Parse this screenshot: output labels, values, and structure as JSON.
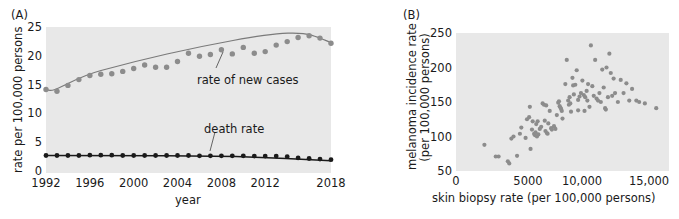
{
  "figure": {
    "background": "#ffffff",
    "plot_background": "#e8e8e8",
    "text_color": "#1a1a1a"
  },
  "panels": {
    "a": {
      "label": "(A)",
      "xlabel": "year",
      "ylabel": "rate per 100,000 persons",
      "yticks": [
        "0",
        "5",
        "10",
        "15",
        "20",
        "25"
      ],
      "xticks": [
        "1992",
        "1996",
        "2000",
        "2004",
        "2008",
        "2012",
        "2018"
      ],
      "annotation_new_cases": "rate of new cases",
      "annotation_death_rate": "death rate",
      "new_cases_color": "#8c8c8c",
      "death_rate_color": "#1a1a1a"
    },
    "b": {
      "label": "(B)",
      "xlabel": "skin biopsy rate (per 100,000 persons)",
      "ylabel_line1": "melanoma incidence rate",
      "ylabel_line2": "(per 100,000 persons)",
      "yticks": [
        "50",
        "100",
        "150",
        "200",
        "250"
      ],
      "xticks": [
        "0",
        "5000",
        "10,000",
        "15,000"
      ],
      "point_color": "#8c8c8c"
    }
  },
  "chart_data": [
    {
      "type": "line",
      "panel": "A",
      "title": "(A)",
      "xlabel": "year",
      "ylabel": "rate per 100,000 persons",
      "xlim": [
        1992,
        2018
      ],
      "ylim": [
        0,
        25
      ],
      "xticks": [
        1992,
        1996,
        2000,
        2004,
        2008,
        2012,
        2018
      ],
      "yticks": [
        0,
        5,
        10,
        15,
        20,
        25
      ],
      "grid": false,
      "legend": "inline-annotations",
      "x": [
        1992,
        1993,
        1994,
        1995,
        1996,
        1997,
        1998,
        1999,
        2000,
        2001,
        2002,
        2003,
        2004,
        2005,
        2006,
        2007,
        2008,
        2009,
        2010,
        2011,
        2012,
        2013,
        2014,
        2015,
        2016,
        2017,
        2018
      ],
      "series": [
        {
          "name": "rate of new cases",
          "marker": "circle",
          "color": "#8c8c8c",
          "trendline": true,
          "values": [
            14.3,
            14.0,
            15.0,
            16.0,
            16.7,
            16.9,
            17.0,
            17.4,
            17.9,
            18.5,
            18.1,
            18.1,
            19.1,
            20.5,
            20.0,
            20.3,
            21.1,
            20.4,
            21.5,
            20.5,
            20.8,
            21.9,
            22.5,
            23.2,
            23.5,
            23.1,
            22.2
          ]
        },
        {
          "name": "death rate",
          "marker": "circle",
          "color": "#1a1a1a",
          "trendline": true,
          "values": [
            3.0,
            3.0,
            3.0,
            3.0,
            3.05,
            3.05,
            3.05,
            3.0,
            3.0,
            3.0,
            3.0,
            3.0,
            3.0,
            3.0,
            2.95,
            2.95,
            2.95,
            2.95,
            2.95,
            2.9,
            2.9,
            2.9,
            2.8,
            2.6,
            2.5,
            2.4,
            2.3
          ]
        }
      ],
      "annotations": [
        {
          "text": "rate of new cases",
          "x": 2008,
          "y": 17.8
        },
        {
          "text": "death rate",
          "x": 2007,
          "y": 6.1
        }
      ]
    },
    {
      "type": "scatter",
      "panel": "B",
      "title": "(B)",
      "xlabel": "skin biopsy rate (per 100,000 persons)",
      "ylabel": "melanoma incidence rate (per 100,000 persons)",
      "xlim": [
        0,
        15000
      ],
      "ylim": [
        50,
        250
      ],
      "xticks": [
        0,
        5000,
        10000,
        15000
      ],
      "yticks": [
        50,
        100,
        150,
        200,
        250
      ],
      "grid": false,
      "marker": "circle",
      "color": "#8c8c8c",
      "points": [
        [
          2000,
          88
        ],
        [
          2800,
          71
        ],
        [
          3000,
          71
        ],
        [
          3650,
          64
        ],
        [
          3750,
          61
        ],
        [
          3900,
          97
        ],
        [
          4050,
          100
        ],
        [
          4300,
          72
        ],
        [
          4500,
          104
        ],
        [
          4600,
          113
        ],
        [
          4900,
          98
        ],
        [
          5000,
          125
        ],
        [
          5150,
          128
        ],
        [
          5200,
          143
        ],
        [
          5250,
          82
        ],
        [
          5350,
          110
        ],
        [
          5400,
          122
        ],
        [
          5500,
          104
        ],
        [
          5550,
          102
        ],
        [
          5600,
          106
        ],
        [
          5650,
          118
        ],
        [
          5700,
          100
        ],
        [
          5750,
          122
        ],
        [
          5800,
          103
        ],
        [
          5900,
          111
        ],
        [
          6000,
          114
        ],
        [
          6100,
          148
        ],
        [
          6200,
          146
        ],
        [
          6250,
          123
        ],
        [
          6300,
          108
        ],
        [
          6400,
          105
        ],
        [
          6450,
          104
        ],
        [
          6500,
          119
        ],
        [
          6600,
          137
        ],
        [
          6700,
          112
        ],
        [
          6750,
          110
        ],
        [
          6900,
          115
        ],
        [
          7000,
          111
        ],
        [
          7100,
          131
        ],
        [
          7200,
          149
        ],
        [
          7250,
          151
        ],
        [
          7300,
          144
        ],
        [
          7350,
          142
        ],
        [
          7400,
          140
        ],
        [
          7450,
          137
        ],
        [
          7500,
          126
        ],
        [
          7700,
          176
        ],
        [
          7800,
          211
        ],
        [
          7900,
          152
        ],
        [
          7950,
          146
        ],
        [
          8000,
          157
        ],
        [
          8100,
          136
        ],
        [
          8200,
          185
        ],
        [
          8250,
          174
        ],
        [
          8300,
          161
        ],
        [
          8400,
          175
        ],
        [
          8500,
          196
        ],
        [
          8600,
          153
        ],
        [
          8700,
          158
        ],
        [
          8800,
          163
        ],
        [
          8900,
          181
        ],
        [
          9000,
          160
        ],
        [
          9100,
          157
        ],
        [
          9200,
          166
        ],
        [
          9250,
          152
        ],
        [
          9300,
          176
        ],
        [
          9400,
          143
        ],
        [
          9500,
          232
        ],
        [
          9600,
          173
        ],
        [
          9700,
          159
        ],
        [
          9800,
          211
        ],
        [
          9900,
          155
        ],
        [
          10000,
          152
        ],
        [
          10100,
          163
        ],
        [
          10200,
          150
        ],
        [
          10300,
          197
        ],
        [
          10400,
          171
        ],
        [
          10500,
          141
        ],
        [
          10600,
          200
        ],
        [
          10700,
          157
        ],
        [
          10800,
          220
        ],
        [
          10900,
          192
        ],
        [
          11000,
          159
        ],
        [
          11100,
          184
        ],
        [
          11200,
          163
        ],
        [
          11400,
          150
        ],
        [
          11600,
          182
        ],
        [
          11800,
          163
        ],
        [
          12000,
          177
        ],
        [
          12200,
          152
        ],
        [
          12400,
          169
        ],
        [
          12700,
          152
        ],
        [
          12900,
          150
        ],
        [
          13300,
          148
        ],
        [
          14100,
          141
        ],
        [
          8050,
          148
        ],
        [
          8600,
          138
        ],
        [
          9050,
          137
        ],
        [
          10550,
          139
        ],
        [
          6350,
          145
        ]
      ]
    }
  ]
}
